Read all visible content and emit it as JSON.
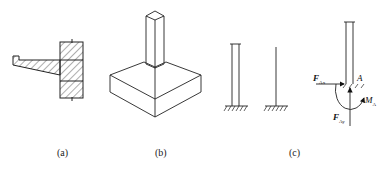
{
  "figures": [
    {
      "id": "a",
      "caption": "(a)",
      "description": "cantilever slab embedded in wall (hatched section)"
    },
    {
      "id": "b",
      "caption": "(b)",
      "description": "column on stepped pad footing (isometric)"
    },
    {
      "id": "c",
      "caption": "(c)",
      "description": "fixed-support column simplifications and free-body diagram"
    }
  ],
  "labels": {
    "fax_main": "F",
    "fax_sub": "Ax",
    "fay_main": "F",
    "fay_sub": "Ay",
    "point_a": "A",
    "ma_main": "M",
    "ma_sub": "A"
  },
  "colors": {
    "stroke": "#222222",
    "background": "#ffffff"
  }
}
